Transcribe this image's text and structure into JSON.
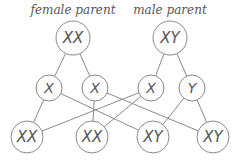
{
  "diagram": {
    "title_left": "female parent",
    "title_right": "male parent",
    "colors": {
      "stroke": "#8a8a8a",
      "text": "#555555",
      "background": "#ffffff"
    },
    "parents": [
      {
        "id": "female",
        "label": "XX",
        "x": 73,
        "y": 38,
        "r": 17
      },
      {
        "id": "male",
        "label": "XY",
        "x": 170,
        "y": 38,
        "r": 17
      }
    ],
    "gametes": [
      {
        "id": "g1",
        "label": "X",
        "x": 49,
        "y": 88,
        "r": 13,
        "parent": "female"
      },
      {
        "id": "g2",
        "label": "X",
        "x": 95,
        "y": 88,
        "r": 13,
        "parent": "female"
      },
      {
        "id": "g3",
        "label": "X",
        "x": 151,
        "y": 88,
        "r": 13,
        "parent": "male"
      },
      {
        "id": "g4",
        "label": "Y",
        "x": 192,
        "y": 88,
        "r": 13,
        "parent": "male"
      }
    ],
    "offspring": [
      {
        "id": "o1",
        "label": "XX",
        "x": 27,
        "y": 137,
        "r": 16
      },
      {
        "id": "o2",
        "label": "XX",
        "x": 92,
        "y": 137,
        "r": 16
      },
      {
        "id": "o3",
        "label": "XY",
        "x": 153,
        "y": 137,
        "r": 16
      },
      {
        "id": "o4",
        "label": "XY",
        "x": 213,
        "y": 137,
        "r": 16
      }
    ],
    "edges": [
      [
        "female",
        "g1"
      ],
      [
        "female",
        "g2"
      ],
      [
        "male",
        "g3"
      ],
      [
        "male",
        "g4"
      ],
      [
        "g1",
        "o1"
      ],
      [
        "g1",
        "o3"
      ],
      [
        "g2",
        "o2"
      ],
      [
        "g2",
        "o4"
      ],
      [
        "g3",
        "o1"
      ],
      [
        "g3",
        "o2"
      ],
      [
        "g4",
        "o3"
      ],
      [
        "g4",
        "o4"
      ]
    ]
  }
}
